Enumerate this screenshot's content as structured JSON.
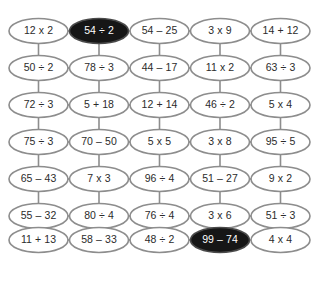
{
  "grid": {
    "columns": 5,
    "rows": 8,
    "cell_width": 59,
    "cell_height": 25,
    "col_centers": [
      38.5,
      99,
      159.5,
      220,
      280.5
    ],
    "row_centers": [
      31,
      68,
      105,
      142,
      179,
      216,
      240,
      277
    ],
    "outline_color": "#8d8d8d",
    "fill_color": "#ffffff",
    "text_color": "#2b2b2b",
    "highlight_fill": "#161616",
    "highlight_text_color": "#ffffff",
    "background_color": "#ffffff"
  },
  "cells": [
    [
      {
        "label": "12 x 2",
        "highlighted": false
      },
      {
        "label": "54 ÷ 2",
        "highlighted": true
      },
      {
        "label": "54 – 25",
        "highlighted": false
      },
      {
        "label": "3 x 9",
        "highlighted": false
      },
      {
        "label": "14 + 12",
        "highlighted": false
      }
    ],
    [
      {
        "label": "50 ÷ 2",
        "highlighted": false
      },
      {
        "label": "78 ÷ 3",
        "highlighted": false
      },
      {
        "label": "44 – 17",
        "highlighted": false
      },
      {
        "label": "11 x 2",
        "highlighted": false
      },
      {
        "label": "63 ÷ 3",
        "highlighted": false
      }
    ],
    [
      {
        "label": "72 ÷ 3",
        "highlighted": false
      },
      {
        "label": "5 + 18",
        "highlighted": false
      },
      {
        "label": "12 + 14",
        "highlighted": false
      },
      {
        "label": "46 ÷ 2",
        "highlighted": false
      },
      {
        "label": "5 x 4",
        "highlighted": false
      }
    ],
    [
      {
        "label": "75 ÷ 3",
        "highlighted": false
      },
      {
        "label": "70 – 50",
        "highlighted": false
      },
      {
        "label": "5 x 5",
        "highlighted": false
      },
      {
        "label": "3 x 8",
        "highlighted": false
      },
      {
        "label": "95 ÷ 5",
        "highlighted": false
      }
    ],
    [
      {
        "label": "65 – 43",
        "highlighted": false
      },
      {
        "label": "7 x 3",
        "highlighted": false
      },
      {
        "label": "96 ÷ 4",
        "highlighted": false
      },
      {
        "label": "51 – 27",
        "highlighted": false
      },
      {
        "label": "9 x 2",
        "highlighted": false
      }
    ],
    [
      {
        "label": "55 – 32",
        "highlighted": false
      },
      {
        "label": "80 ÷ 4",
        "highlighted": false
      },
      {
        "label": "76 ÷ 4",
        "highlighted": false
      },
      {
        "label": "3 x 6",
        "highlighted": false
      },
      {
        "label": "51 ÷ 3",
        "highlighted": false
      }
    ],
    [
      {
        "label": "11 + 13",
        "highlighted": false
      },
      {
        "label": "58 – 33",
        "highlighted": false
      },
      {
        "label": "48 ÷ 2",
        "highlighted": false
      },
      {
        "label": "99 – 74",
        "highlighted": true
      },
      {
        "label": "4 x 4",
        "highlighted": false
      }
    ]
  ]
}
